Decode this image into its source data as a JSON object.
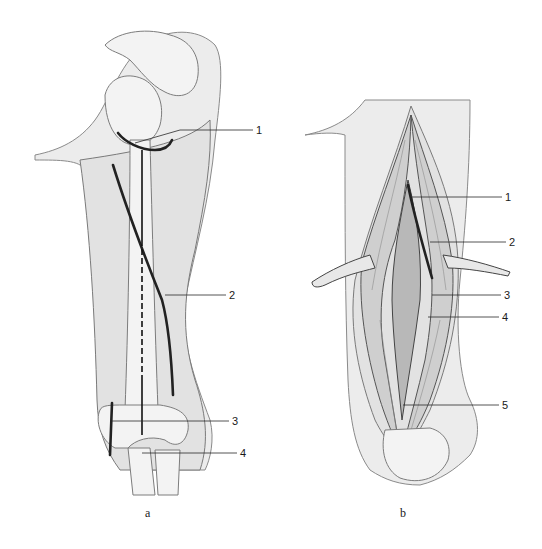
{
  "figure": {
    "type": "anatomical-illustration",
    "panels": [
      {
        "id": "a",
        "caption": "a",
        "callouts": [
          {
            "number": "1"
          },
          {
            "number": "2"
          },
          {
            "number": "3"
          },
          {
            "number": "4"
          }
        ]
      },
      {
        "id": "b",
        "caption": "b",
        "callouts": [
          {
            "number": "1"
          },
          {
            "number": "2"
          },
          {
            "number": "3"
          },
          {
            "number": "4"
          },
          {
            "number": "5"
          }
        ]
      }
    ]
  },
  "colors": {
    "background": "#ffffff",
    "ink": "#1a1a1a",
    "skin": "#ececec",
    "muscle": "#cfcfcf"
  }
}
